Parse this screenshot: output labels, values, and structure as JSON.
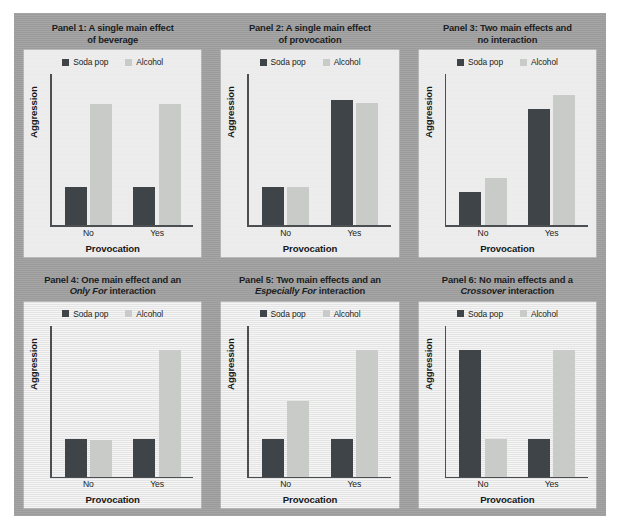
{
  "figure": {
    "background_color": "#a0a0a0",
    "panel_background_color": "#efefef",
    "series_colors": {
      "soda_pop": "#3f4448",
      "alcohol": "#c9cbc9"
    }
  },
  "legend": {
    "soda_label": "Soda pop",
    "alcohol_label": "Alcohol",
    "soda_swatch": "soda-pop-swatch",
    "alcohol_swatch": "alcohol-swatch"
  },
  "axis": {
    "ylabel": "Aggression",
    "xlabel": "Provocation",
    "xticks": [
      "No",
      "Yes"
    ]
  },
  "panels": [
    {
      "title_line1": "Panel 1: A single main effect",
      "title_line2_plain": "of beverage",
      "title_line2_italic": "",
      "title_line2_tail": ""
    },
    {
      "title_line1": "Panel 2: A single main effect",
      "title_line2_plain": "of provocation",
      "title_line2_italic": "",
      "title_line2_tail": ""
    },
    {
      "title_line1": "Panel 3: Two main effects and",
      "title_line2_plain": "no interaction",
      "title_line2_italic": "",
      "title_line2_tail": ""
    },
    {
      "title_line1": "Panel 4: One main effect and an",
      "title_line2_plain": "",
      "title_line2_italic": "Only For",
      "title_line2_tail": " interaction"
    },
    {
      "title_line1": "Panel 5: Two main effects and an",
      "title_line2_plain": "",
      "title_line2_italic": "Especially For",
      "title_line2_tail": " interaction"
    },
    {
      "title_line1": "Panel 6: No main effects and a",
      "title_line2_plain": "",
      "title_line2_italic": "Crossover",
      "title_line2_tail": " interaction"
    }
  ],
  "chart_data": [
    {
      "type": "bar",
      "title": "Panel 1: A single main effect of beverage",
      "xlabel": "Provocation",
      "ylabel": "Aggression",
      "categories": [
        "No",
        "Yes"
      ],
      "ylim": [
        0,
        100
      ],
      "grid": false,
      "legend_position": "top-center",
      "series": [
        {
          "name": "Soda pop",
          "color": "#3f4448",
          "values": [
            25,
            25
          ]
        },
        {
          "name": "Alcohol",
          "color": "#c9cbc9",
          "values": [
            80,
            80
          ]
        }
      ]
    },
    {
      "type": "bar",
      "title": "Panel 2: A single main effect of provocation",
      "xlabel": "Provocation",
      "ylabel": "Aggression",
      "categories": [
        "No",
        "Yes"
      ],
      "ylim": [
        0,
        100
      ],
      "grid": false,
      "legend_position": "top-center",
      "series": [
        {
          "name": "Soda pop",
          "color": "#3f4448",
          "values": [
            25,
            83
          ]
        },
        {
          "name": "Alcohol",
          "color": "#c9cbc9",
          "values": [
            25,
            81
          ]
        }
      ]
    },
    {
      "type": "bar",
      "title": "Panel 3: Two main effects and no interaction",
      "xlabel": "Provocation",
      "ylabel": "Aggression",
      "categories": [
        "No",
        "Yes"
      ],
      "ylim": [
        0,
        100
      ],
      "grid": false,
      "legend_position": "top-center",
      "series": [
        {
          "name": "Soda pop",
          "color": "#3f4448",
          "values": [
            22,
            77
          ]
        },
        {
          "name": "Alcohol",
          "color": "#c9cbc9",
          "values": [
            31,
            86
          ]
        }
      ]
    },
    {
      "type": "bar",
      "title": "Panel 4: One main effect and an Only For interaction",
      "xlabel": "Provocation",
      "ylabel": "Aggression",
      "categories": [
        "No",
        "Yes"
      ],
      "ylim": [
        0,
        100
      ],
      "grid": false,
      "legend_position": "top-center",
      "series": [
        {
          "name": "Soda pop",
          "color": "#3f4448",
          "values": [
            25,
            25
          ]
        },
        {
          "name": "Alcohol",
          "color": "#c9cbc9",
          "values": [
            24,
            84
          ]
        }
      ]
    },
    {
      "type": "bar",
      "title": "Panel 5: Two main effects and an Especially For interaction",
      "xlabel": "Provocation",
      "ylabel": "Aggression",
      "categories": [
        "No",
        "Yes"
      ],
      "ylim": [
        0,
        100
      ],
      "grid": false,
      "legend_position": "top-center",
      "series": [
        {
          "name": "Soda pop",
          "color": "#3f4448",
          "values": [
            25,
            25
          ]
        },
        {
          "name": "Alcohol",
          "color": "#c9cbc9",
          "values": [
            50,
            84
          ]
        }
      ]
    },
    {
      "type": "bar",
      "title": "Panel 6: No main effects and a Crossover interaction",
      "xlabel": "Provocation",
      "ylabel": "Aggression",
      "categories": [
        "No",
        "Yes"
      ],
      "ylim": [
        0,
        100
      ],
      "grid": false,
      "legend_position": "top-center",
      "series": [
        {
          "name": "Soda pop",
          "color": "#3f4448",
          "values": [
            84,
            25
          ]
        },
        {
          "name": "Alcohol",
          "color": "#c9cbc9",
          "values": [
            25,
            84
          ]
        }
      ]
    }
  ]
}
